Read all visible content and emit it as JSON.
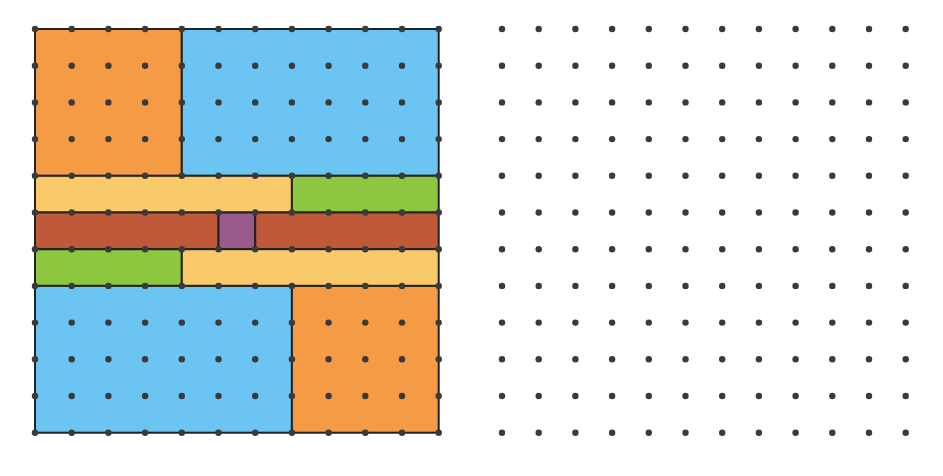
{
  "figure": {
    "left_panel": {
      "grid_units": 11,
      "origin": [
        35,
        29
      ],
      "unit_px": 36.7,
      "dot_color": "#3a3a3a",
      "stroke_color": "#222222",
      "pieces": [
        {
          "name": "orange-top-left",
          "x": 0,
          "y": 0,
          "w": 4,
          "h": 4,
          "color": "#F59B45"
        },
        {
          "name": "blue-top-right",
          "x": 4,
          "y": 0,
          "w": 7,
          "h": 4,
          "color": "#6CC4F2"
        },
        {
          "name": "yellow-strip-1",
          "x": 0,
          "y": 4,
          "w": 7,
          "h": 1,
          "color": "#F9C96A"
        },
        {
          "name": "green-strip-1",
          "x": 7,
          "y": 4,
          "w": 4,
          "h": 1,
          "color": "#8DC63F"
        },
        {
          "name": "brick-strip-left",
          "x": 0,
          "y": 5,
          "w": 5,
          "h": 1,
          "color": "#C0583A"
        },
        {
          "name": "purple-center",
          "x": 5,
          "y": 5,
          "w": 1,
          "h": 1,
          "color": "#9B5A8C"
        },
        {
          "name": "brick-strip-right",
          "x": 6,
          "y": 5,
          "w": 5,
          "h": 1,
          "color": "#C0583A"
        },
        {
          "name": "green-strip-2",
          "x": 0,
          "y": 6,
          "w": 4,
          "h": 1,
          "color": "#8DC63F"
        },
        {
          "name": "yellow-strip-2",
          "x": 4,
          "y": 6,
          "w": 7,
          "h": 1,
          "color": "#F9C96A"
        },
        {
          "name": "blue-bottom-left",
          "x": 0,
          "y": 7,
          "w": 7,
          "h": 4,
          "color": "#6CC4F2"
        },
        {
          "name": "orange-bottom-right",
          "x": 7,
          "y": 7,
          "w": 4,
          "h": 4,
          "color": "#F59B45"
        }
      ]
    },
    "right_panel": {
      "dots_x": 12,
      "dots_y": 12,
      "origin": [
        502,
        29
      ],
      "unit_px": 36.7,
      "dot_color": "#3a3a3a"
    }
  }
}
